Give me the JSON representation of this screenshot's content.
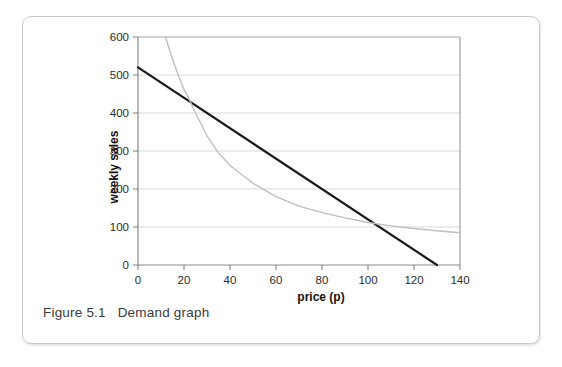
{
  "figure": {
    "caption": "Figure 5.1   Demand graph",
    "border_color": "#c8c8c8",
    "background": "#ffffff"
  },
  "chart_data": {
    "type": "line",
    "title": "",
    "xlabel": "price (p)",
    "ylabel": "weekly sales",
    "xlim": [
      0,
      140
    ],
    "ylim": [
      0,
      600
    ],
    "xticks": [
      0,
      20,
      40,
      60,
      80,
      100,
      120,
      140
    ],
    "yticks": [
      0,
      100,
      200,
      300,
      400,
      500,
      600
    ],
    "grid": "horizontal",
    "legend": "none",
    "series": [
      {
        "name": "demand-line",
        "kind": "line",
        "color": "#1a1a1a",
        "width": 2.2,
        "x": [
          0,
          130
        ],
        "y": [
          520,
          0
        ]
      },
      {
        "name": "revenue-curve",
        "kind": "curve",
        "color": "#bfbfbf",
        "width": 1.4,
        "x": [
          12,
          14,
          16,
          18,
          20,
          22,
          25,
          30,
          35,
          40,
          50,
          60,
          70,
          80,
          90,
          100,
          110,
          120,
          130,
          140
        ],
        "y": [
          600,
          560,
          525,
          492,
          462,
          440,
          400,
          340,
          295,
          262,
          215,
          180,
          155,
          138,
          124,
          112,
          103,
          96,
          90,
          85
        ]
      }
    ]
  },
  "axis_labels": {
    "x_tick_0": "0",
    "x_tick_1": "20",
    "x_tick_2": "40",
    "x_tick_3": "60",
    "x_tick_4": "80",
    "x_tick_5": "100",
    "x_tick_6": "120",
    "x_tick_7": "140",
    "y_tick_0": "0",
    "y_tick_1": "100",
    "y_tick_2": "200",
    "y_tick_3": "300",
    "y_tick_4": "400",
    "y_tick_5": "500",
    "y_tick_6": "600"
  }
}
